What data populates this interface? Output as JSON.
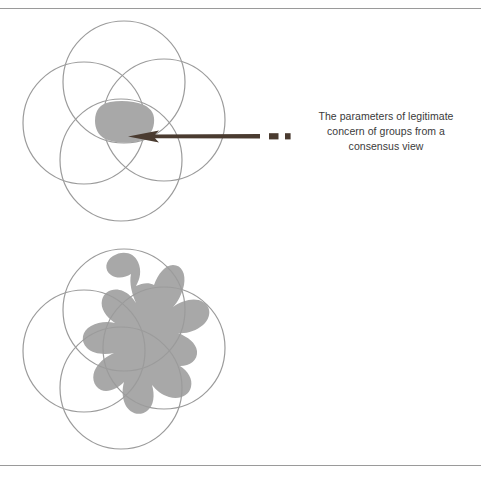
{
  "figure": {
    "background_color": "#ffffff",
    "rule_color": "#9a9a9a",
    "circle_stroke_color": "#9b9b9b",
    "shaded_region_color": "#a8a8a8",
    "arrow_color": "#4a3b30",
    "text_color": "#3a3a3a"
  },
  "diagrams": [
    {
      "id": "consensus-view",
      "description": "Four overlapping outlined circles with a small shaded lens-shaped region at their common intersection",
      "circle_count": 4,
      "shaded_region_label": "small central intersection",
      "caption": "The parameters of legitimate\nconcern of groups from a\nconsensus view",
      "caption_lines": [
        "The parameters of legitimate",
        "concern of groups from a",
        "consensus view"
      ]
    },
    {
      "id": "diversity-valued",
      "description": "Four overlapping outlined circles with a large irregular lobed shaded blob spanning nearly the whole union",
      "circle_count": 4,
      "shaded_region_label": "large irregular union blob",
      "caption": "The parameters of legitimate\nconcern of partnerships when\ndiversity is valued",
      "caption_lines": [
        "The parameters of legitimate",
        "concern of partnerships when",
        "diversity is valued"
      ]
    }
  ],
  "markers": {
    "dash_label": "dash",
    "square_label": "square"
  }
}
